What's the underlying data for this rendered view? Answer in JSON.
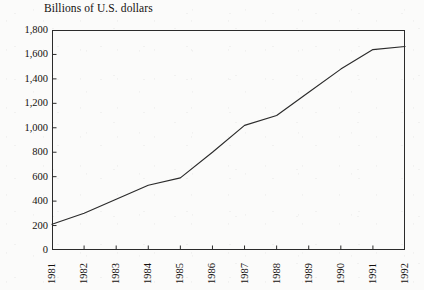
{
  "chart_data": {
    "type": "line",
    "title": "Billions of U.S. dollars",
    "xlabel": "",
    "ylabel": "",
    "grid": false,
    "legend": "none",
    "categories": [
      "1981",
      "1982",
      "1983",
      "1984",
      "1985",
      "1986",
      "1987",
      "1988",
      "1989",
      "1990",
      "1991",
      "1992"
    ],
    "x": [
      1981,
      1982,
      1983,
      1984,
      1985,
      1986,
      1987,
      1988,
      1989,
      1990,
      1991,
      1992
    ],
    "values": [
      210,
      300,
      415,
      530,
      590,
      800,
      1020,
      1100,
      1290,
      1480,
      1640,
      1665
    ],
    "series": [
      {
        "name": "Billions of U.S. dollars",
        "values": [
          210,
          300,
          415,
          530,
          590,
          800,
          1020,
          1100,
          1290,
          1480,
          1640,
          1665
        ]
      }
    ],
    "xlim": [
      1981,
      1992
    ],
    "ylim": [
      0,
      1800
    ],
    "ytick_labels": [
      "1,800",
      "1,600",
      "1,400",
      "1,200",
      "1,000",
      "800",
      "600",
      "400",
      "200",
      "0"
    ],
    "ytick_values": [
      1800,
      1600,
      1400,
      1200,
      1000,
      800,
      600,
      400,
      200,
      0
    ],
    "xtick_labels": [
      "1981",
      "1982",
      "1983",
      "1984",
      "1985",
      "1986",
      "1987",
      "1988",
      "1989",
      "1990",
      "1991",
      "1992"
    ],
    "line_color": "#2b2b2b",
    "axis_color": "#2b2b2b",
    "background_color": "#fbfbfa"
  }
}
